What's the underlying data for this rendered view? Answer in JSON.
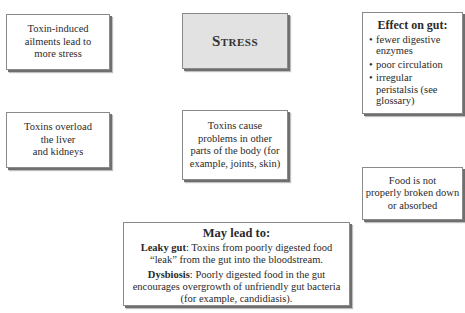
{
  "diagram": {
    "stress": {
      "title": "Stress"
    },
    "boxes": {
      "toxin_induced": "Toxin-induced ailments lead to more stress",
      "toxins_overload": [
        "Toxins overload",
        "the liver",
        "and kidneys"
      ],
      "toxins_cause": "Toxins cause problems in other parts of the body (for example, joints, skin)",
      "food_not": [
        "Food is not",
        "properly broken down",
        "or absorbed"
      ]
    },
    "effect_on_gut": {
      "title": "Effect on gut:",
      "items": [
        "fewer digestive enzymes",
        "poor circulation",
        "irregular peristalsis (see glossary)"
      ]
    },
    "may_lead_to": {
      "title": "May lead to:",
      "leaky_gut": {
        "term": "Leaky gut",
        "text": ": Toxins from poorly digested food “leak” from the gut into the bloodstream."
      },
      "dysbiosis": {
        "term": "Dysbiosis",
        "text": ": Poorly digested food in the gut encourages overgrowth of unfriendly gut bacteria (for example, candidiasis)."
      }
    }
  },
  "colors": {
    "stress_fill": "#e2e2e2",
    "box_fill": "#ffffff",
    "shadow": "#6f6f6f"
  }
}
